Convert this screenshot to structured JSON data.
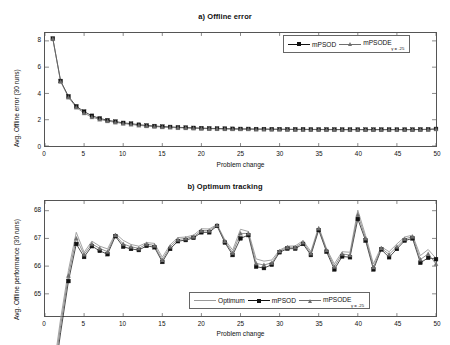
{
  "figure": {
    "background": "#ffffff",
    "width": 450,
    "height": 345
  },
  "colors": {
    "mpsod": "#111111",
    "mpsode": "#6e6e6e",
    "optimum": "#9a9a9a",
    "axis": "#555555",
    "text": "#111111"
  },
  "panel_a": {
    "title": "a) Offline error",
    "xlabel": "Problem change",
    "ylabel": "Avg. Offline error (30 runs)",
    "xticks": [
      "0",
      "5",
      "10",
      "15",
      "20",
      "25",
      "30",
      "35",
      "40",
      "45",
      "50"
    ],
    "yticks": [
      "0",
      "2",
      "4",
      "6",
      "8"
    ],
    "legend": {
      "items": [
        {
          "label": "mPSOD",
          "sub": "",
          "marker": "square",
          "color": "#111111"
        },
        {
          "label": "mPSODE",
          "sub": "γ = .25",
          "marker": "triangle",
          "color": "#6e6e6e"
        }
      ]
    }
  },
  "panel_b": {
    "title": "b) Optimum tracking",
    "xlabel": "Problem change",
    "ylabel": "Avg.  Offline performance (30 runs)",
    "xticks": [
      "0",
      "5",
      "10",
      "15",
      "20",
      "25",
      "30",
      "35",
      "40",
      "45",
      "50"
    ],
    "yticks": [
      "65",
      "66",
      "67",
      "68"
    ],
    "legend": {
      "items": [
        {
          "label": "Optimum",
          "sub": "",
          "marker": "none",
          "color": "#9a9a9a"
        },
        {
          "label": "mPSOD",
          "sub": "",
          "marker": "square",
          "color": "#111111"
        },
        {
          "label": "mPSODE",
          "sub": "γ = .25",
          "marker": "triangle",
          "color": "#6e6e6e"
        }
      ]
    }
  },
  "chart_data": [
    {
      "id": "offline-error",
      "type": "line",
      "title": "a) Offline error",
      "xlabel": "Problem change",
      "ylabel": "Avg. Offline error (30 runs)",
      "xlim": [
        0,
        50
      ],
      "ylim": [
        0,
        8.6
      ],
      "grid": false,
      "legend_position": "top-right",
      "x": [
        1,
        2,
        3,
        4,
        5,
        6,
        7,
        8,
        9,
        10,
        11,
        12,
        13,
        14,
        15,
        16,
        17,
        18,
        19,
        20,
        21,
        22,
        23,
        24,
        25,
        26,
        27,
        28,
        29,
        30,
        31,
        32,
        33,
        34,
        35,
        36,
        37,
        38,
        39,
        40,
        41,
        42,
        43,
        44,
        45,
        46,
        47,
        48,
        49,
        50
      ],
      "series": [
        {
          "name": "mPSOD",
          "marker": "square",
          "color": "#111111",
          "values": [
            8.18,
            4.95,
            3.78,
            3.02,
            2.62,
            2.3,
            2.1,
            1.96,
            1.86,
            1.76,
            1.7,
            1.62,
            1.56,
            1.52,
            1.48,
            1.45,
            1.42,
            1.4,
            1.38,
            1.36,
            1.34,
            1.33,
            1.32,
            1.31,
            1.3,
            1.3,
            1.29,
            1.29,
            1.28,
            1.28,
            1.27,
            1.27,
            1.27,
            1.26,
            1.26,
            1.26,
            1.26,
            1.25,
            1.25,
            1.25,
            1.25,
            1.25,
            1.25,
            1.25,
            1.25,
            1.25,
            1.25,
            1.26,
            1.27,
            1.3
          ]
        },
        {
          "name": "mPSODE",
          "sub": "γ = .25",
          "marker": "triangle",
          "color": "#6e6e6e",
          "values": [
            8.16,
            4.9,
            3.7,
            2.94,
            2.5,
            2.2,
            2.02,
            1.9,
            1.8,
            1.71,
            1.64,
            1.57,
            1.52,
            1.48,
            1.44,
            1.41,
            1.39,
            1.37,
            1.35,
            1.33,
            1.32,
            1.31,
            1.3,
            1.29,
            1.28,
            1.28,
            1.27,
            1.27,
            1.26,
            1.26,
            1.26,
            1.25,
            1.25,
            1.25,
            1.25,
            1.24,
            1.24,
            1.24,
            1.24,
            1.24,
            1.24,
            1.24,
            1.24,
            1.24,
            1.24,
            1.24,
            1.24,
            1.25,
            1.26,
            1.28
          ]
        }
      ]
    },
    {
      "id": "optimum-tracking",
      "type": "line",
      "title": "b) Optimum tracking",
      "xlabel": "Problem change",
      "ylabel": "Avg.  Offline performance (30 runs)",
      "xlim": [
        0,
        50
      ],
      "ylim": [
        64.2,
        68.35
      ],
      "grid": false,
      "legend_position": "bottom-right",
      "x": [
        1,
        2,
        3,
        4,
        5,
        6,
        7,
        8,
        9,
        10,
        11,
        12,
        13,
        14,
        15,
        16,
        17,
        18,
        19,
        20,
        21,
        22,
        23,
        24,
        25,
        26,
        27,
        28,
        29,
        30,
        31,
        32,
        33,
        34,
        35,
        36,
        37,
        38,
        39,
        40,
        41,
        42,
        43,
        44,
        45,
        46,
        47,
        48,
        49,
        50
      ],
      "series": [
        {
          "name": "Optimum",
          "marker": "none",
          "color": "#9a9a9a",
          "values": [
            62.1,
            64.1,
            65.85,
            67.22,
            66.5,
            66.9,
            66.72,
            66.62,
            67.18,
            66.93,
            66.78,
            66.72,
            66.85,
            66.82,
            66.32,
            66.77,
            67.03,
            67.05,
            67.12,
            67.35,
            67.34,
            67.5,
            66.95,
            66.58,
            67.33,
            67.25,
            66.26,
            66.18,
            66.22,
            66.58,
            66.72,
            66.73,
            66.92,
            66.53,
            67.42,
            66.63,
            66.08,
            66.52,
            66.5,
            68.02,
            67.1,
            66.08,
            66.7,
            66.52,
            66.8,
            67.05,
            67.12,
            66.38,
            66.6,
            66.28
          ]
        },
        {
          "name": "mPSOD",
          "marker": "square",
          "color": "#111111",
          "values": [
            61.6,
            63.6,
            65.46,
            66.8,
            66.33,
            66.72,
            66.55,
            66.43,
            67.08,
            66.7,
            66.62,
            66.58,
            66.73,
            66.68,
            66.15,
            66.62,
            66.9,
            66.94,
            67.02,
            67.22,
            67.22,
            67.45,
            66.85,
            66.4,
            67.0,
            67.12,
            65.98,
            65.93,
            66.05,
            66.5,
            66.63,
            66.63,
            66.8,
            66.4,
            67.3,
            66.52,
            65.88,
            66.35,
            66.32,
            67.7,
            66.92,
            65.88,
            66.6,
            66.32,
            66.62,
            66.92,
            67.0,
            66.12,
            66.3,
            66.25
          ]
        },
        {
          "name": "mPSODE",
          "sub": "γ = .25",
          "marker": "triangle",
          "color": "#6e6e6e",
          "values": [
            61.85,
            63.85,
            65.66,
            67.0,
            66.42,
            66.8,
            66.64,
            66.52,
            67.12,
            66.8,
            66.7,
            66.64,
            66.8,
            66.74,
            66.22,
            66.7,
            66.96,
            67.0,
            67.06,
            67.28,
            67.28,
            67.48,
            66.9,
            66.48,
            67.18,
            67.18,
            66.1,
            66.04,
            66.12,
            66.54,
            66.68,
            66.68,
            66.86,
            66.46,
            67.36,
            66.58,
            65.98,
            66.44,
            66.4,
            67.86,
            67.0,
            65.96,
            66.65,
            66.42,
            66.7,
            66.98,
            67.06,
            66.24,
            66.44,
            66.08
          ]
        }
      ]
    }
  ]
}
